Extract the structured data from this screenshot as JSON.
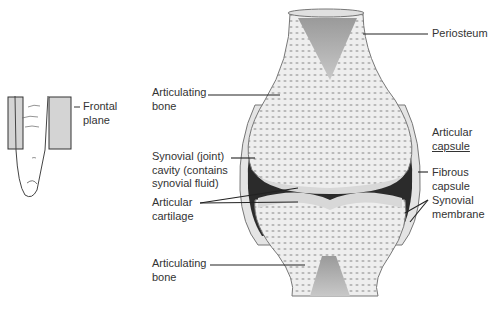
{
  "inset": {
    "label_line1": "Frontal",
    "label_line2": "plane"
  },
  "labels": {
    "articulating_bone_top": {
      "line1": "Articulating",
      "line2": "bone"
    },
    "synovial_cavity": {
      "line1": "Synovial (joint)",
      "line2": "cavity (contains",
      "line3": "synovial fluid)"
    },
    "articular_cartilage": {
      "line1": "Articular",
      "line2": "cartilage"
    },
    "articulating_bone_bottom": {
      "line1": "Articulating",
      "line2": "bone"
    },
    "periosteum": {
      "line1": "Periosteum"
    },
    "articular_capsule": {
      "line1": "Articular",
      "line2": "capsule"
    },
    "fibrous_capsule": {
      "line1": "Fibrous",
      "line2": "capsule"
    },
    "synovial_membrane": {
      "line1": "Synovial",
      "line2": "membrane"
    }
  },
  "colors": {
    "bone_fill": "#e9e9e9",
    "cavity": "#2b2b2b",
    "cartilage": "#d8d8d8",
    "marrow": "#8a8a8a",
    "plane": "#d4d4d4"
  }
}
